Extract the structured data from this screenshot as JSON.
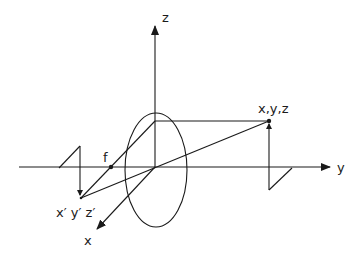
{
  "diagram": {
    "type": "optics-projection",
    "stroke_color": "#1a1a1a",
    "background": "#ffffff",
    "labels": {
      "z_axis": "z",
      "y_axis": "y",
      "x_axis": "x",
      "object_point": "x,y,z",
      "image_point": "x′ y′ z′",
      "focal_point": "f"
    },
    "elements": [
      "z-axis-arrow",
      "y-axis-arrow",
      "x-axis-arrow",
      "lens-ellipse",
      "object-point",
      "image-point",
      "focal-point",
      "object-height-arrow",
      "image-height-arrow",
      "ray-through-center",
      "ray-through-focus"
    ]
  }
}
